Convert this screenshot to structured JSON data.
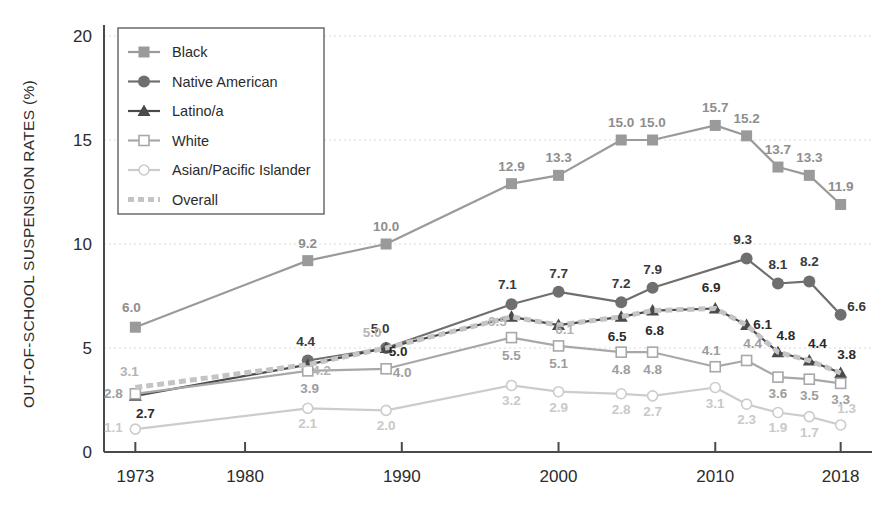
{
  "chart_data": {
    "type": "line",
    "title": "",
    "xlabel": "",
    "ylabel": "OUT-OF-SCHOOL SUSPENSION RATES (%)",
    "xlim": [
      1971,
      2020
    ],
    "ylim": [
      0,
      20
    ],
    "xticks": [
      1973,
      1980,
      1990,
      2000,
      2010,
      2018
    ],
    "xtick_labels": [
      "1973",
      "1980",
      "1990",
      "2000",
      "2010",
      "2018"
    ],
    "yticks": [
      0,
      5,
      10,
      15,
      20
    ],
    "ytick_labels": [
      "0",
      "5",
      "10",
      "15",
      "20"
    ],
    "grid": true,
    "legend_position": "top-left",
    "x": [
      1973,
      1984,
      1989,
      1997,
      2000,
      2004,
      2006,
      2010,
      2012,
      2014,
      2016,
      2018
    ],
    "series": [
      {
        "name": "Black",
        "color": "#9a9a9a",
        "marker": "square-filled",
        "dash": "solid",
        "values": [
          6.0,
          9.2,
          10.0,
          12.9,
          13.3,
          15.0,
          15.0,
          15.7,
          15.2,
          13.7,
          13.3,
          11.9
        ],
        "labels": [
          "6.0",
          "9.2",
          "10.0",
          "12.9",
          "13.3",
          "15.0",
          "15.0",
          "15.7",
          "15.2",
          "13.7",
          "13.3",
          "11.9"
        ]
      },
      {
        "name": "Native American",
        "color": "#6f6f6f",
        "marker": "circle-filled",
        "dash": "solid",
        "values": [
          null,
          4.4,
          5.0,
          7.1,
          7.7,
          7.2,
          7.9,
          null,
          9.3,
          8.1,
          8.2,
          6.6
        ],
        "labels": [
          "",
          "4.4",
          "5.0",
          "7.1",
          "7.7",
          "7.2",
          "7.9",
          "",
          "9.3",
          "8.1",
          "8.2",
          "6.6"
        ]
      },
      {
        "name": "Latino/a",
        "color": "#4a4a4a",
        "marker": "triangle-filled",
        "dash": "solid",
        "values": [
          2.7,
          4.2,
          5.0,
          6.5,
          6.1,
          6.5,
          6.8,
          6.9,
          6.1,
          4.8,
          4.4,
          3.8
        ],
        "labels": [
          "2.7",
          "",
          "5.0",
          "",
          "",
          "6.5",
          "6.8",
          "6.9",
          "6.1",
          "4.8",
          "4.4",
          "3.8"
        ]
      },
      {
        "name": "White",
        "color": "#a8a8a8",
        "marker": "square-open",
        "dash": "solid",
        "values": [
          2.8,
          3.9,
          4.0,
          5.5,
          5.1,
          4.8,
          4.8,
          4.1,
          4.4,
          3.6,
          3.5,
          3.3
        ],
        "labels": [
          "2.8",
          "3.9",
          "4.0",
          "5.5",
          "5.1",
          "4.8",
          "4.8",
          "4.1",
          "4.4",
          "3.6",
          "3.5",
          "3.3"
        ]
      },
      {
        "name": "Asian/Pacific Islander",
        "color": "#cccccc",
        "marker": "circle-open",
        "dash": "solid",
        "values": [
          1.1,
          2.1,
          2.0,
          3.2,
          2.9,
          2.8,
          2.7,
          3.1,
          2.3,
          1.9,
          1.7,
          1.3
        ],
        "labels": [
          "1.1",
          "2.1",
          "2.0",
          "3.2",
          "2.9",
          "2.8",
          "2.7",
          "3.1",
          "2.3",
          "1.9",
          "1.7",
          "1.3"
        ]
      },
      {
        "name": "Overall",
        "color": "#c4c4c4",
        "marker": "none",
        "dash": "dashed",
        "values": [
          3.1,
          4.2,
          5.0,
          6.5,
          6.1,
          6.5,
          6.8,
          6.9,
          6.1,
          4.8,
          4.4,
          3.8
        ],
        "labels": [
          "3.1",
          "4.2",
          "5.0",
          "6.5",
          "6.1",
          "",
          "",
          "",
          "",
          "",
          "",
          ""
        ]
      }
    ]
  },
  "legend": {
    "items": [
      {
        "label": "Black"
      },
      {
        "label": "Native American"
      },
      {
        "label": "Latino/a"
      },
      {
        "label": "White"
      },
      {
        "label": "Asian/Pacific Islander"
      },
      {
        "label": "Overall"
      }
    ]
  }
}
